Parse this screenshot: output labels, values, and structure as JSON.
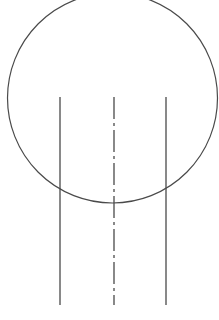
{
  "diagram": {
    "type": "technical-drawing",
    "stroke_color": "#4a4a4a",
    "background": "#ffffff",
    "circle": {
      "cx": 112.5,
      "cy": 98,
      "r": 105,
      "stroke_width": 1.2
    },
    "lines": [
      {
        "name": "left-edge-line",
        "x": 60,
        "y1": 97,
        "y2": 305,
        "style": "solid"
      },
      {
        "name": "centerline",
        "x": 114,
        "y1": 97,
        "y2": 305,
        "style": "dash-dot",
        "dasharray": "22 4 3 4"
      },
      {
        "name": "right-edge-line",
        "x": 166,
        "y1": 97,
        "y2": 305,
        "style": "solid"
      }
    ]
  }
}
